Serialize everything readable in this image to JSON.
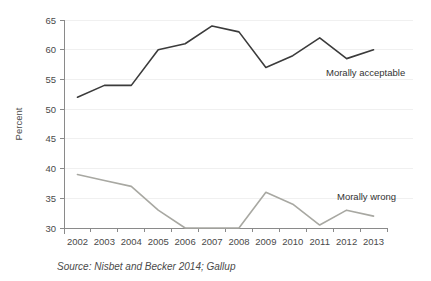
{
  "chart_data": {
    "type": "line",
    "title": "",
    "xlabel": "",
    "ylabel": "Percent",
    "ylim": [
      30,
      65
    ],
    "yticks": [
      30,
      35,
      40,
      45,
      50,
      55,
      60,
      65
    ],
    "grid": true,
    "legend_position": "inline-right",
    "categories": [
      "2002",
      "2003",
      "2004",
      "2005",
      "2006",
      "2007",
      "2008",
      "2009",
      "2010",
      "2011",
      "2012",
      "2013"
    ],
    "x": [
      2002,
      2003,
      2004,
      2005,
      2006,
      2007,
      2008,
      2009,
      2010,
      2011,
      2012,
      2013
    ],
    "series": [
      {
        "name": "Morally acceptable",
        "color": "#3b3b3b",
        "values": [
          52,
          54,
          54,
          60,
          61,
          64,
          63,
          57,
          59,
          62,
          58.5,
          60
        ]
      },
      {
        "name": "Morally wrong",
        "color": "#a8a8a2",
        "values": [
          39,
          38,
          37,
          33,
          30,
          30,
          30,
          36,
          34,
          30.5,
          33,
          32
        ]
      }
    ],
    "annotations": [
      {
        "text": "Morally acceptable",
        "series": 0
      },
      {
        "text": "Morally wrong",
        "series": 1
      }
    ],
    "caption": "Source: Nisbet and Becker 2014; Gallup"
  },
  "axis": {
    "y_title": "Percent",
    "y_tick_labels": [
      "65",
      "60",
      "55",
      "50",
      "45",
      "40",
      "35",
      "30"
    ],
    "x_tick_labels": [
      "2002",
      "2003",
      "2004",
      "2005",
      "2006",
      "2007",
      "2008",
      "2009",
      "2010",
      "2011",
      "2012",
      "2013"
    ]
  },
  "labels": {
    "series_acceptable": "Morally acceptable",
    "series_wrong": "Morally wrong"
  },
  "caption": {
    "source": "Source: Nisbet and Becker 2014; Gallup"
  },
  "colors": {
    "line_acceptable": "#3b3b3b",
    "line_wrong": "#a8a8a2",
    "axis": "#8a8a8a",
    "grid": "#f0f0f0",
    "background": "#ffffff"
  }
}
